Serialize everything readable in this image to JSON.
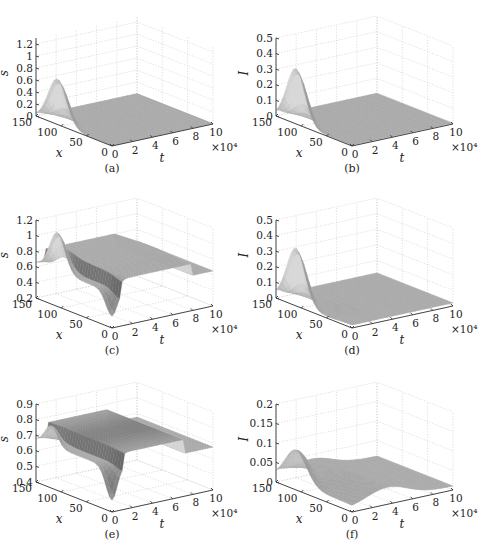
{
  "figure": {
    "panels": [
      {
        "id": "a",
        "caption": "(a)",
        "zlabel": "s",
        "zticks": [
          "0",
          "0.2",
          "0.4",
          "0.6",
          "0.8",
          "1",
          "1.2"
        ],
        "zmin": 0,
        "zmax": 1.3
      },
      {
        "id": "b",
        "caption": "(b)",
        "zlabel": "I",
        "zticks": [
          "0",
          "0.1",
          "0.2",
          "0.3",
          "0.4",
          "0.5"
        ],
        "zmin": 0,
        "zmax": 0.5
      },
      {
        "id": "c",
        "caption": "(c)",
        "zlabel": "s",
        "zticks": [
          "0.2",
          "0.4",
          "0.6",
          "0.8",
          "1",
          "1.2"
        ],
        "zmin": 0.2,
        "zmax": 1.2
      },
      {
        "id": "d",
        "caption": "(d)",
        "zlabel": "I",
        "zticks": [
          "0",
          "0.1",
          "0.2",
          "0.3",
          "0.4",
          "0.5"
        ],
        "zmin": 0,
        "zmax": 0.5
      },
      {
        "id": "e",
        "caption": "(e)",
        "zlabel": "s",
        "zticks": [
          "0.4",
          "0.5",
          "0.6",
          "0.7",
          "0.8",
          "0.9"
        ],
        "zmin": 0.4,
        "zmax": 0.9
      },
      {
        "id": "f",
        "caption": "(f)",
        "zlabel": "I",
        "zticks": [
          "0",
          "0.05",
          "0.1",
          "0.15",
          "0.2"
        ],
        "zmin": 0,
        "zmax": 0.2
      }
    ],
    "x_axis": {
      "label": "x",
      "ticks": [
        "0",
        "50",
        "100",
        "150"
      ]
    },
    "t_axis": {
      "label": "t",
      "ticks": [
        "0",
        "2",
        "4",
        "6",
        "8",
        "10"
      ],
      "multiplier": "×10⁴"
    }
  },
  "chart_data": [
    {
      "type": "surface",
      "panel": "(a)",
      "title": "",
      "xlabel": "t",
      "ylabel": "x",
      "zlabel": "s",
      "x_range": [
        0,
        100000
      ],
      "y_range": [
        0,
        150
      ],
      "zlim": [
        0,
        1.3
      ],
      "xticks": [
        0,
        2,
        4,
        6,
        8,
        10
      ],
      "x_multiplier": "×10^4",
      "yticks": [
        0,
        50,
        100,
        150
      ],
      "zticks": [
        0,
        0.2,
        0.4,
        0.6,
        0.8,
        1,
        1.2
      ],
      "description": "Early-time Gaussian peak in s (~0.75) near x≈100–120, t≈0; thereafter the surface is flat near 0 over all x and t."
    },
    {
      "type": "surface",
      "panel": "(b)",
      "title": "",
      "xlabel": "t",
      "ylabel": "x",
      "zlabel": "I",
      "x_range": [
        0,
        100000
      ],
      "y_range": [
        0,
        150
      ],
      "zlim": [
        0,
        0.5
      ],
      "xticks": [
        0,
        2,
        4,
        6,
        8,
        10
      ],
      "x_multiplier": "×10^4",
      "yticks": [
        0,
        50,
        100,
        150
      ],
      "zticks": [
        0,
        0.1,
        0.2,
        0.3,
        0.4,
        0.5
      ],
      "description": "Early-time peak in I (~0.35) near x≈110, t≈0; decays to ~0 plateau for later t."
    },
    {
      "type": "surface",
      "panel": "(c)",
      "title": "",
      "xlabel": "t",
      "ylabel": "x",
      "zlabel": "s",
      "x_range": [
        0,
        100000
      ],
      "y_range": [
        0,
        150
      ],
      "zlim": [
        0.2,
        1.2
      ],
      "xticks": [
        0,
        2,
        4,
        6,
        8,
        10
      ],
      "x_multiplier": "×10^4",
      "yticks": [
        0,
        50,
        100,
        150
      ],
      "zticks": [
        0.2,
        0.4,
        0.6,
        0.8,
        1,
        1.2
      ],
      "description": "Initial peak in s (~0.9) near x≈100 with dips to ~0.2 at the edges; settles into a ridge ~0.8–0.85 across x for t up to ~8×10^4, then drops to a ~0.65 plateau."
    },
    {
      "type": "surface",
      "panel": "(d)",
      "title": "",
      "xlabel": "t",
      "ylabel": "x",
      "zlabel": "I",
      "x_range": [
        0,
        100000
      ],
      "y_range": [
        0,
        150
      ],
      "zlim": [
        0,
        0.5
      ],
      "xticks": [
        0,
        2,
        4,
        6,
        8,
        10
      ],
      "x_multiplier": "×10^4",
      "yticks": [
        0,
        50,
        100,
        150
      ],
      "zticks": [
        0,
        0.1,
        0.2,
        0.3,
        0.4,
        0.5
      ],
      "description": "Initial peak in I (~0.35) near x≈110; decays toward a small plateau (~0.02) with a slight trough near x≈50 at early t."
    },
    {
      "type": "surface",
      "panel": "(e)",
      "title": "",
      "xlabel": "t",
      "ylabel": "x",
      "zlabel": "s",
      "x_range": [
        0,
        100000
      ],
      "y_range": [
        0,
        150
      ],
      "zlim": [
        0.4,
        0.9
      ],
      "xticks": [
        0,
        2,
        4,
        6,
        8,
        10
      ],
      "x_multiplier": "×10^4",
      "yticks": [
        0,
        50,
        100,
        150
      ],
      "zticks": [
        0.4,
        0.5,
        0.6,
        0.7,
        0.8,
        0.9
      ],
      "description": "Early oscillation (peaks ~0.7, dips ~0.4); long ridge ~0.78–0.8 across t≈1–7×10^4, then drops to a ~0.68 plateau."
    },
    {
      "type": "surface",
      "panel": "(f)",
      "title": "",
      "xlabel": "t",
      "ylabel": "x",
      "zlabel": "I",
      "x_range": [
        0,
        100000
      ],
      "y_range": [
        0,
        150
      ],
      "zlim": [
        0,
        0.2
      ],
      "xticks": [
        0,
        2,
        4,
        6,
        8,
        10
      ],
      "x_multiplier": "×10^4",
      "yticks": [
        0,
        50,
        100,
        150
      ],
      "zticks": [
        0,
        0.05,
        0.1,
        0.15,
        0.2
      ],
      "description": "Small early peak in I (~0.085) near x≈110; later a low ridge ~0.04–0.05 across x for t≈2–6×10^4, decaying toward ~0.02."
    }
  ]
}
